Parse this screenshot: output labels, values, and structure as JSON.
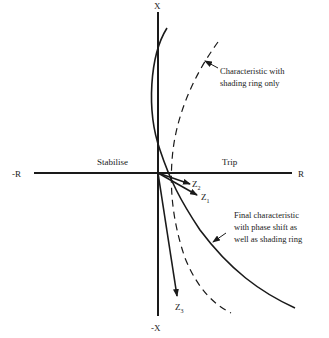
{
  "diagram": {
    "axes": {
      "x_pos_label": "X",
      "x_neg_label": "-X",
      "r_pos_label": "R",
      "r_neg_label": "-R"
    },
    "regions": {
      "left": "Stabilise",
      "right": "Trip"
    },
    "vectors": [
      {
        "name": "Z",
        "sub": "2"
      },
      {
        "name": "Z",
        "sub": "1"
      },
      {
        "name": "Z",
        "sub": "3"
      }
    ],
    "annotations": {
      "dashed_curve": [
        "Characteristic with",
        "shading ring only"
      ],
      "solid_curve": [
        "Final characteristic",
        "with phase shift as",
        "well as shading ring"
      ]
    },
    "colors": {
      "ink": "#1a1a1a",
      "background": "#ffffff"
    }
  }
}
